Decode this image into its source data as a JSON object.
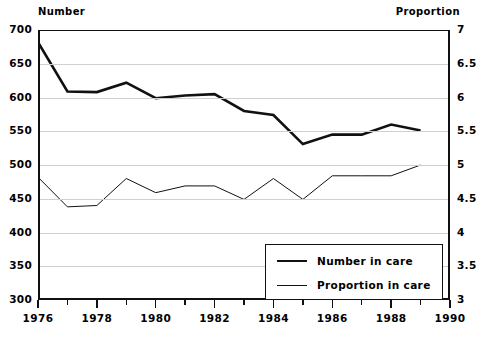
{
  "chart_data": {
    "type": "line",
    "title": "",
    "xlabel": "",
    "ylabel": "Number",
    "y2label": "Proportion",
    "grid": true,
    "legend_position": "bottom-right",
    "x": [
      1976,
      1977,
      1978,
      1979,
      1980,
      1981,
      1982,
      1983,
      1984,
      1985,
      1986,
      1987,
      1988,
      1989
    ],
    "xlim": [
      1976,
      1990
    ],
    "xticks": [
      1976,
      1977,
      1978,
      1979,
      1980,
      1981,
      1982,
      1983,
      1984,
      1985,
      1986,
      1987,
      1988,
      1989,
      1990
    ],
    "xtick_labels": [
      "1976",
      "",
      "1978",
      "",
      "1980",
      "",
      "1982",
      "",
      "1984",
      "",
      "1986",
      "",
      "1988",
      "",
      "1990"
    ],
    "ylim": [
      300,
      700
    ],
    "yticks": [
      300,
      350,
      400,
      450,
      500,
      550,
      600,
      650,
      700
    ],
    "ytick_labels": [
      "300",
      "350",
      "400",
      "450",
      "500",
      "550",
      "600",
      "650",
      "700"
    ],
    "y2lim": [
      3,
      7
    ],
    "y2ticks": [
      3,
      3.5,
      4,
      4.5,
      5,
      5.5,
      6,
      6.5,
      7
    ],
    "y2tick_labels": [
      "3",
      "3.5",
      "4",
      "4.5",
      "5",
      "5.5",
      "6",
      "6.5",
      "7"
    ],
    "series": [
      {
        "name": "Number in care",
        "axis": "left",
        "color": "#111111",
        "linewidth": 2.6,
        "values": [
          682,
          609,
          608,
          622,
          599,
          603,
          605,
          580,
          574,
          531,
          545,
          545,
          560,
          551
        ]
      },
      {
        "name": "Proportion in care",
        "axis": "right",
        "color": "#111111",
        "linewidth": 1.0,
        "values": [
          4.82,
          4.38,
          4.4,
          4.8,
          4.59,
          4.69,
          4.69,
          4.49,
          4.8,
          4.49,
          4.84,
          4.84,
          4.84,
          5.0
        ]
      }
    ]
  },
  "labels": {
    "left_axis_header": "Number",
    "right_axis_header": "Proportion"
  },
  "legend": {
    "items": [
      {
        "label": "Number in care",
        "style": "thick"
      },
      {
        "label": "Proportion in care",
        "style": "thin"
      }
    ]
  }
}
